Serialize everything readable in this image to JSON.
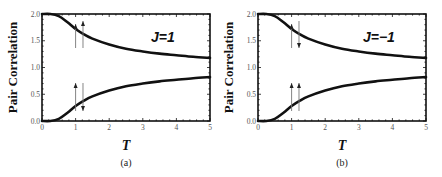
{
  "chart_data": [
    {
      "type": "line",
      "panel_label": "(a)",
      "annotation": "J=1",
      "xlabel": "T",
      "ylabel": "Pair Correlation",
      "xlim": [
        0,
        5
      ],
      "ylim": [
        0,
        2
      ],
      "xticks": [
        "0",
        "1",
        "2",
        "3",
        "4",
        "5"
      ],
      "yticks": [
        "0.0",
        "0.5",
        "1.0",
        "1.5",
        "2.0"
      ],
      "x": [
        0,
        0.25,
        0.5,
        0.75,
        1.0,
        1.25,
        1.5,
        2.0,
        2.5,
        3.0,
        3.5,
        4.0,
        4.5,
        5.0
      ],
      "series": [
        {
          "name": "upper (parallel spins ↑↑)",
          "values": [
            2.0,
            2.0,
            1.96,
            1.85,
            1.72,
            1.62,
            1.54,
            1.43,
            1.35,
            1.3,
            1.26,
            1.23,
            1.2,
            1.18
          ]
        },
        {
          "name": "lower (antiparallel spins ↑↓)",
          "values": [
            0.0,
            0.0,
            0.04,
            0.15,
            0.28,
            0.38,
            0.46,
            0.57,
            0.65,
            0.7,
            0.74,
            0.77,
            0.8,
            0.82
          ]
        }
      ],
      "arrows": {
        "upper": [
          "up",
          "up"
        ],
        "lower": [
          "up",
          "down"
        ]
      }
    },
    {
      "type": "line",
      "panel_label": "(b)",
      "annotation": "J=−1",
      "xlabel": "T",
      "ylabel": "Pair Correlation",
      "xlim": [
        0,
        5
      ],
      "ylim": [
        0,
        2
      ],
      "xticks": [
        "0",
        "1",
        "2",
        "3",
        "4",
        "5"
      ],
      "yticks": [
        "0.0",
        "0.5",
        "1.0",
        "1.5",
        "2.0"
      ],
      "x": [
        0,
        0.25,
        0.5,
        0.75,
        1.0,
        1.25,
        1.5,
        2.0,
        2.5,
        3.0,
        3.5,
        4.0,
        4.5,
        5.0
      ],
      "series": [
        {
          "name": "upper (antiparallel spins ↑↓)",
          "values": [
            2.0,
            2.0,
            1.96,
            1.85,
            1.72,
            1.62,
            1.54,
            1.43,
            1.35,
            1.3,
            1.26,
            1.23,
            1.2,
            1.18
          ]
        },
        {
          "name": "lower (parallel spins ↑↑)",
          "values": [
            0.0,
            0.0,
            0.04,
            0.15,
            0.28,
            0.38,
            0.46,
            0.57,
            0.65,
            0.7,
            0.74,
            0.77,
            0.8,
            0.82
          ]
        }
      ],
      "arrows": {
        "upper": [
          "up",
          "down"
        ],
        "lower": [
          "up",
          "up"
        ]
      }
    }
  ]
}
